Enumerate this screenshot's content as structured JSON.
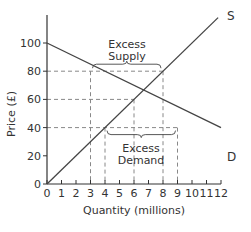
{
  "chart_data": {
    "type": "line",
    "title": "",
    "xlabel": "Quantity (millions)",
    "ylabel": "Price (£)",
    "xlim": [
      0,
      12
    ],
    "ylim": [
      0,
      110
    ],
    "x_ticks": [
      0,
      1,
      2,
      3,
      4,
      5,
      6,
      7,
      8,
      9,
      10,
      11,
      12
    ],
    "y_ticks": [
      0,
      20,
      40,
      60,
      80,
      100
    ],
    "grid": false,
    "legend": "none",
    "series": [
      {
        "name": "D",
        "points": [
          [
            0,
            100
          ],
          [
            12,
            40
          ]
        ]
      },
      {
        "name": "S",
        "points": [
          [
            0,
            0
          ],
          [
            12,
            120
          ]
        ]
      }
    ],
    "reference_lines": {
      "horizontal": [
        {
          "y": 80,
          "x_from": 0,
          "x_to": 8
        },
        {
          "y": 60,
          "x_from": 0,
          "x_to": 6
        },
        {
          "y": 40,
          "x_from": 0,
          "x_to": 9
        }
      ],
      "vertical": [
        {
          "x": 3,
          "y_to": 80
        },
        {
          "x": 4,
          "y_to": 40
        },
        {
          "x": 6,
          "y_to": 60
        },
        {
          "x": 8,
          "y_to": 80
        },
        {
          "x": 9,
          "y_to": 40
        }
      ]
    },
    "annotations": [
      {
        "text": "Excess Supply",
        "lines": [
          "Excess",
          "Supply"
        ],
        "bracket_x": [
          3,
          8
        ],
        "at_price": 80
      },
      {
        "text": "Excess Demand",
        "lines": [
          "Excess",
          "Demand"
        ],
        "bracket_x": [
          4,
          9
        ],
        "at_price": 40
      }
    ],
    "curve_labels": {
      "supply": "S",
      "demand": "D"
    }
  },
  "labels": {
    "xlabel": "Quantity (millions)",
    "ylabel": "Price (£)",
    "supply": "S",
    "demand": "D",
    "excess_supply_1": "Excess",
    "excess_supply_2": "Supply",
    "excess_demand_1": "Excess",
    "excess_demand_2": "Demand"
  },
  "colors": {
    "axis": "#333333",
    "curve": "#444444",
    "dashed": "#888888"
  }
}
